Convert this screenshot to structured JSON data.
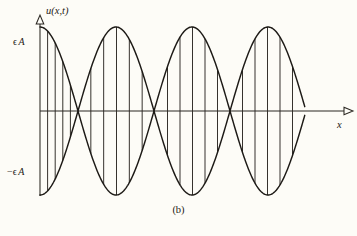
{
  "figure": {
    "caption": "(b)",
    "background_color": "#fdfcf7",
    "ink_color": "#1d1a16"
  },
  "axes": {
    "y_axis_label": "u(x,t)",
    "x_axis_label": "x",
    "y_tick_top_symbol": "ϵ",
    "y_tick_top_amplitude": "A",
    "y_tick_bottom_symbol": "−ϵ",
    "y_tick_bottom_amplitude": "A",
    "origin_px": {
      "x": 40,
      "y": 111
    },
    "x_axis_end_px": 348,
    "y_axis_top_px": 18,
    "y_axis_bottom_px": 196
  },
  "chart_data": {
    "type": "line",
    "title": "",
    "subtitle": "",
    "xlabel": "x",
    "ylabel": "u(x,t)",
    "grid": false,
    "legend": null,
    "annotations": [
      {
        "text": "ϵ A",
        "role": "y-tick-positive",
        "value": 1
      },
      {
        "text": "−ϵ A",
        "role": "y-tick-negative",
        "value": -1
      },
      {
        "text": "(b)",
        "role": "figure-caption"
      }
    ],
    "ylim": [
      -1.18,
      1.18
    ],
    "xlim": [
      0,
      3.5
    ],
    "amplitude": 1,
    "envelope_period_units": 1.0,
    "node_count": 4,
    "node_x_px": [
      78,
      155,
      230,
      305
    ],
    "lobe_count": 4,
    "hatch_lines_per_lobe": 5,
    "series": [
      {
        "name": "upper envelope",
        "expression": "+ϵA cos(kx)",
        "x": [
          0,
          0.125,
          0.25,
          0.375,
          0.5,
          0.625,
          0.75,
          0.875,
          1,
          1.125,
          1.25,
          1.375,
          1.5,
          1.625,
          1.75,
          1.875,
          2,
          2.125,
          2.25,
          2.375,
          2.5,
          2.625,
          2.75,
          2.875,
          3,
          3.125,
          3.25,
          3.375,
          3.5
        ],
        "values": [
          1,
          0.924,
          0.707,
          0.383,
          0,
          -0.383,
          -0.707,
          -0.924,
          -1,
          -0.924,
          -0.707,
          -0.383,
          0,
          0.383,
          0.707,
          0.924,
          1,
          0.924,
          0.707,
          0.383,
          0,
          -0.383,
          -0.707,
          -0.924,
          -1,
          -0.924,
          -0.707,
          -0.383,
          0
        ]
      },
      {
        "name": "lower envelope",
        "expression": "−ϵA cos(kx)",
        "x": [
          0,
          0.125,
          0.25,
          0.375,
          0.5,
          0.625,
          0.75,
          0.875,
          1,
          1.125,
          1.25,
          1.375,
          1.5,
          1.625,
          1.75,
          1.875,
          2,
          2.125,
          2.25,
          2.375,
          2.5,
          2.625,
          2.75,
          2.875,
          3,
          3.125,
          3.25,
          3.375,
          3.5
        ],
        "values": [
          -1,
          -0.924,
          -0.707,
          -0.383,
          0,
          0.383,
          0.707,
          0.924,
          1,
          0.924,
          0.707,
          0.383,
          0,
          -0.383,
          -0.707,
          -0.924,
          -1,
          -0.924,
          -0.707,
          -0.383,
          0,
          0.383,
          0.707,
          0.924,
          1,
          0.924,
          0.707,
          0.383,
          0
        ]
      }
    ]
  }
}
